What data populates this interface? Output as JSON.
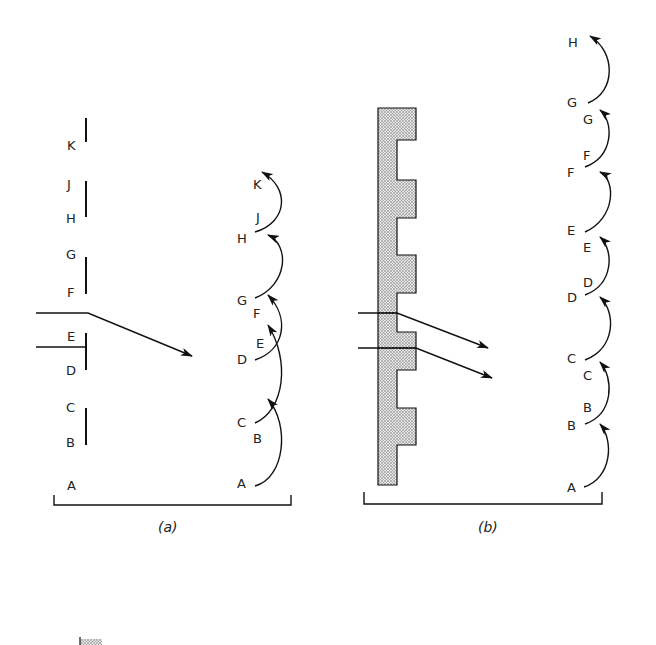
{
  "panel_a": {
    "caption": "(a)",
    "left_labels": [
      {
        "text": "K",
        "x": 67,
        "y": 150
      },
      {
        "text": "J",
        "x": 67,
        "y": 189
      },
      {
        "text": "H",
        "x": 66,
        "y": 223
      },
      {
        "text": "G",
        "x": 66,
        "y": 259
      },
      {
        "text": "F",
        "x": 67,
        "y": 297
      },
      {
        "text": "E",
        "x": 67,
        "y": 341
      },
      {
        "text": "D",
        "x": 66,
        "y": 375
      },
      {
        "text": "C",
        "x": 66,
        "y": 412
      },
      {
        "text": "B",
        "x": 66,
        "y": 447
      },
      {
        "text": "A",
        "x": 67,
        "y": 490
      }
    ],
    "slits": [
      {
        "y1": 118,
        "y2": 142
      },
      {
        "y1": 181,
        "y2": 217
      },
      {
        "y1": 257,
        "y2": 294
      },
      {
        "y1": 333,
        "y2": 370
      },
      {
        "y1": 408,
        "y2": 445
      }
    ],
    "right_labels": [
      {
        "text": "K",
        "x": 253,
        "y": 189
      },
      {
        "text": "J",
        "x": 256,
        "y": 222
      },
      {
        "text": "H",
        "x": 237,
        "y": 243
      },
      {
        "text": "G",
        "x": 237,
        "y": 305
      },
      {
        "text": "F",
        "x": 253,
        "y": 318
      },
      {
        "text": "E",
        "x": 256,
        "y": 348
      },
      {
        "text": "D",
        "x": 237,
        "y": 364
      },
      {
        "text": "C",
        "x": 237,
        "y": 427
      },
      {
        "text": "B",
        "x": 253,
        "y": 443
      },
      {
        "text": "A",
        "x": 237,
        "y": 488
      }
    ]
  },
  "panel_b": {
    "caption": "(b)",
    "right_labels": [
      {
        "text": "H",
        "x": 568,
        "y": 47
      },
      {
        "text": "G",
        "x": 567,
        "y": 107
      },
      {
        "text": "G",
        "x": 583,
        "y": 124
      },
      {
        "text": "F",
        "x": 583,
        "y": 160
      },
      {
        "text": "F",
        "x": 567,
        "y": 177
      },
      {
        "text": "E",
        "x": 567,
        "y": 235
      },
      {
        "text": "E",
        "x": 583,
        "y": 252
      },
      {
        "text": "D",
        "x": 583,
        "y": 287
      },
      {
        "text": "D",
        "x": 567,
        "y": 302
      },
      {
        "text": "C",
        "x": 567,
        "y": 363
      },
      {
        "text": "C",
        "x": 583,
        "y": 380
      },
      {
        "text": "B",
        "x": 583,
        "y": 412
      },
      {
        "text": "B",
        "x": 567,
        "y": 430
      },
      {
        "text": "A",
        "x": 567,
        "y": 492
      }
    ]
  },
  "legend_swatch": {
    "label": ""
  }
}
